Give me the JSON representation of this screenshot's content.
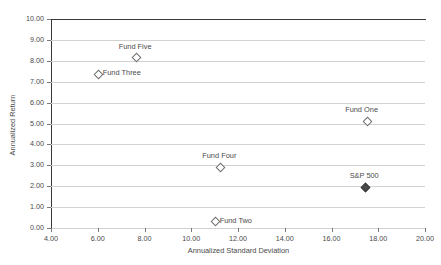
{
  "chart_data": {
    "type": "scatter",
    "title": "",
    "xlabel": "Annualized Standard Deviation",
    "ylabel": "Annualized Return",
    "xlim": [
      4.0,
      20.0
    ],
    "ylim": [
      0.0,
      10.0
    ],
    "xticks": [
      "4.00",
      "6.00",
      "8.00",
      "10.00",
      "12.00",
      "14.00",
      "16.00",
      "18.00",
      "20.00"
    ],
    "xtick_values": [
      4,
      6,
      8,
      10,
      12,
      14,
      16,
      18,
      20
    ],
    "yticks": [
      "0.00",
      "1.00",
      "2.00",
      "3.00",
      "4.00",
      "5.00",
      "6.00",
      "7.00",
      "8.00",
      "9.00",
      "10.00"
    ],
    "ytick_values": [
      0,
      1,
      2,
      3,
      4,
      5,
      6,
      7,
      8,
      9,
      10
    ],
    "grid": "horizontal",
    "legend": "none",
    "points": [
      {
        "name": "Fund Five",
        "x": 7.6,
        "y": 8.2,
        "marker": "open-diamond",
        "label_pos": "above"
      },
      {
        "name": "Fund Three",
        "x": 6.0,
        "y": 7.4,
        "marker": "open-diamond",
        "label_pos": "right"
      },
      {
        "name": "Fund One",
        "x": 17.5,
        "y": 5.15,
        "marker": "open-diamond",
        "label_pos": "above-left"
      },
      {
        "name": "Fund Four",
        "x": 11.2,
        "y": 2.95,
        "marker": "open-diamond",
        "label_pos": "above"
      },
      {
        "name": "S&P 500",
        "x": 17.4,
        "y": 2.0,
        "marker": "filled-diamond",
        "label_pos": "above"
      },
      {
        "name": "Fund Two",
        "x": 11.0,
        "y": 0.35,
        "marker": "open-diamond",
        "label_pos": "right"
      }
    ]
  },
  "colors": {
    "axis": "#3a3a3a",
    "gridline": "#d2d2d2",
    "text": "#4a4a4a",
    "marker_open_stroke": "#6e6e6e",
    "marker_filled": "#4a4a4a",
    "background": "#ffffff"
  }
}
